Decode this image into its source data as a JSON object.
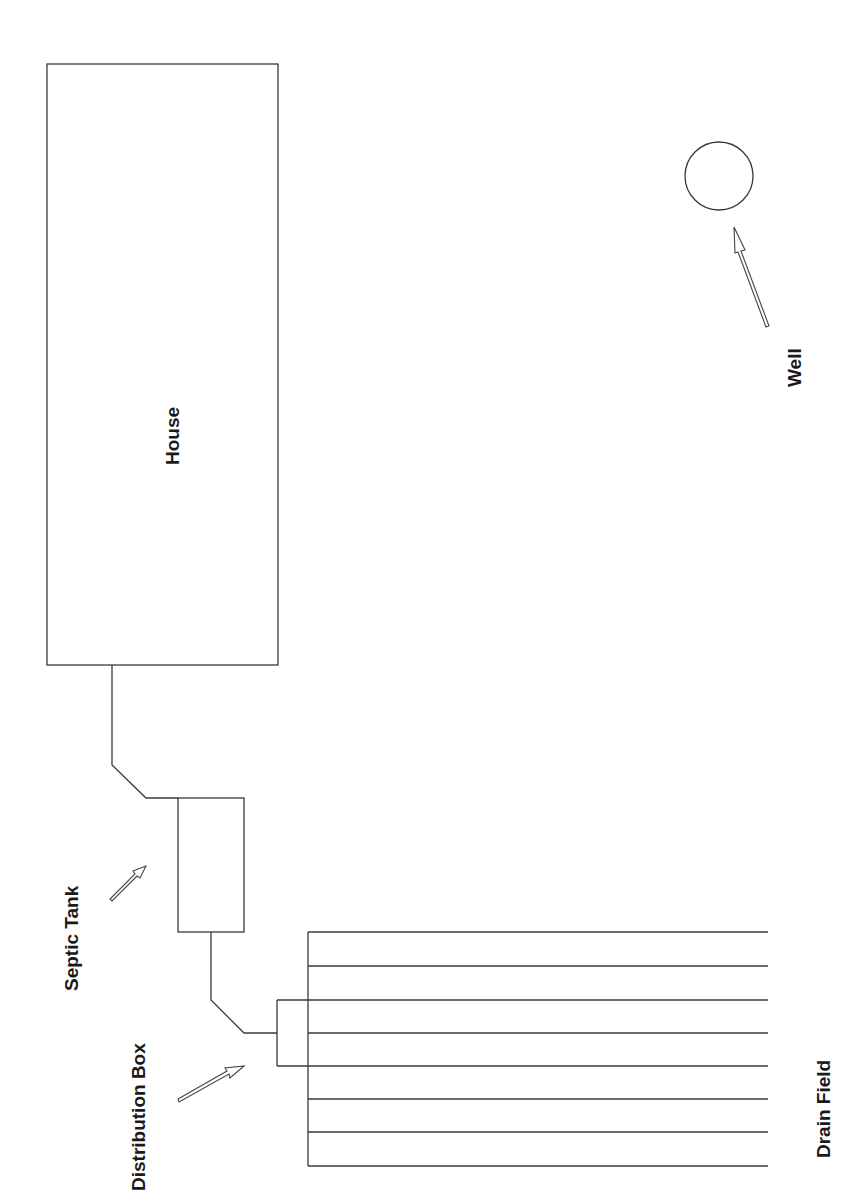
{
  "diagram": {
    "colors": {
      "line": "#3a3a3a",
      "text": "#1a1a1a",
      "background": "#ffffff"
    },
    "labels": {
      "house": "House",
      "well": "Well",
      "septic_tank": "Septic Tank",
      "distribution_box": "Distribution Box",
      "drain_field": "Drain Field"
    },
    "components": [
      {
        "id": "house",
        "shape": "rectangle",
        "label": "House"
      },
      {
        "id": "septic_tank",
        "shape": "rectangle",
        "label": "Septic Tank"
      },
      {
        "id": "distribution_box",
        "shape": "rectangle",
        "label": "Distribution Box"
      },
      {
        "id": "drain_field",
        "shape": "parallel-lines",
        "line_count": 8,
        "label": "Drain Field"
      },
      {
        "id": "well",
        "shape": "circle",
        "label": "Well"
      }
    ],
    "connections": [
      {
        "from": "house",
        "to": "septic_tank",
        "type": "pipe"
      },
      {
        "from": "septic_tank",
        "to": "distribution_box",
        "type": "pipe"
      },
      {
        "from": "distribution_box",
        "to": "drain_field",
        "type": "pipe"
      }
    ],
    "pointers": [
      {
        "label": "Well",
        "target": "well"
      },
      {
        "label": "Septic Tank",
        "target": "septic_tank"
      },
      {
        "label": "Distribution Box",
        "target": "distribution_box"
      }
    ]
  }
}
